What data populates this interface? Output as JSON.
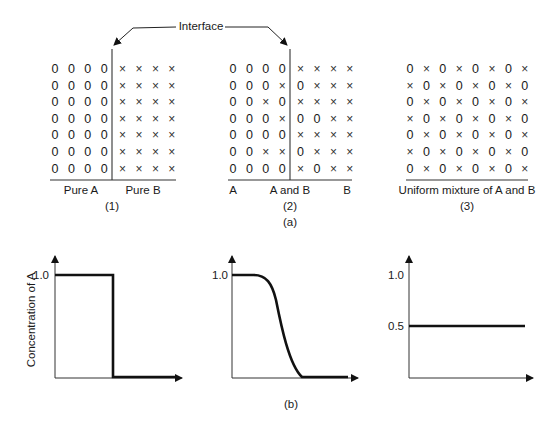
{
  "figure": {
    "interface_label": "Interface",
    "part_a_caption": "(a)",
    "part_b_caption": "(b)"
  },
  "panels": [
    {
      "id": "1",
      "caption": "(1)",
      "labels": [
        {
          "text": "Pure A",
          "x": 81
        },
        {
          "text": "Pure B",
          "x": 143
        }
      ],
      "has_interface": true,
      "interface_x": 111,
      "origin_x": 55,
      "grid": [
        "0000xxxx",
        "0000xxxx",
        "0000xxxx",
        "0000xxxx",
        "0000xxxx",
        "0000xxxx",
        "0000xxxx"
      ]
    },
    {
      "id": "2",
      "caption": "(2)",
      "labels": [
        {
          "text": "A",
          "x": 233
        },
        {
          "text": "A and B",
          "x": 290
        },
        {
          "text": "B",
          "x": 347
        }
      ],
      "has_interface": true,
      "interface_x": 290,
      "origin_x": 233,
      "grid": [
        "0000xxxx",
        "000x0xxx",
        "00x0xxxx",
        "000x00xx",
        "0000xxxx",
        "00xx0xxx",
        "0000x0xx"
      ]
    },
    {
      "id": "3",
      "caption": "(3)",
      "labels": [
        {
          "text": "Uniform mixture of A and B",
          "x": 467
        }
      ],
      "has_interface": false,
      "origin_x": 410,
      "grid": [
        "0x0x0x0x",
        "x0x0x0x0",
        "0x0x0x0x",
        "x0x0x0x0",
        "0x0x0x0x",
        "x0x0x0x0",
        "0x0x0x0x"
      ]
    }
  ],
  "legend": {
    "symbol_0": "0",
    "symbol_x": "×"
  },
  "chart_data": [
    {
      "type": "line",
      "title": "",
      "xlabel": "",
      "ylabel": "Concentration of A",
      "yticks": [
        "1.0"
      ],
      "description": "Step function: pure A then pure B",
      "x": [
        0,
        0.45,
        0.45,
        1.0
      ],
      "y": [
        1.0,
        1.0,
        0.0,
        0.0
      ],
      "ylim": [
        0,
        1.35
      ]
    },
    {
      "type": "line",
      "title": "",
      "xlabel": "",
      "ylabel": "",
      "yticks": [
        "1.0"
      ],
      "description": "Sigmoidal decrease from 1.0 to 0 across interface",
      "x": [
        0,
        0.18,
        0.3,
        0.4,
        0.5,
        0.6,
        0.72,
        1.0
      ],
      "y": [
        1.0,
        1.0,
        0.9,
        0.7,
        0.35,
        0.1,
        0.0,
        0.0
      ],
      "ylim": [
        0,
        1.35
      ]
    },
    {
      "type": "line",
      "title": "",
      "xlabel": "",
      "ylabel": "",
      "yticks": [
        "1.0",
        "0.5"
      ],
      "description": "Constant concentration 0.5 (uniform mixture)",
      "x": [
        0,
        1.0
      ],
      "y": [
        0.5,
        0.5
      ],
      "ylim": [
        0,
        1.35
      ]
    }
  ],
  "charts": {
    "ylabel": "Concentration of A",
    "c1_tick_1": "1.0",
    "c2_tick_1": "1.0",
    "c3_tick_1": "1.0",
    "c3_tick_05": "0.5"
  }
}
